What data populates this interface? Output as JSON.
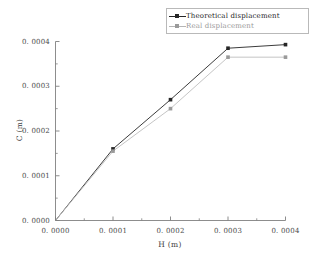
{
  "chart_data": {
    "type": "line",
    "title": "",
    "xlabel": "H (m)",
    "ylabel": "C (m)",
    "xlim": [
      0.0,
      0.0004
    ],
    "ylim": [
      0.0,
      0.0004
    ],
    "xticks": [
      "0. 0000",
      "0. 0001",
      "0. 0002",
      "0. 0003",
      "0. 0004"
    ],
    "xtick_values": [
      0.0,
      0.0001,
      0.0002,
      0.0003,
      0.0004
    ],
    "yticks": [
      "0. 0000",
      "0. 0001",
      "0. 0002",
      "0. 0003",
      "0. 0004"
    ],
    "ytick_values": [
      0.0,
      0.0001,
      0.0002,
      0.0003,
      0.0004
    ],
    "grid": false,
    "minor_ticks": true,
    "legend_position": "top-right",
    "x": [
      0.0,
      0.0001,
      0.0002,
      0.0003,
      0.0004
    ],
    "series": [
      {
        "name": "Theoretical displacement",
        "color": "#262626",
        "marker": "square",
        "values": [
          0.0,
          0.00016,
          0.00027,
          0.000385,
          0.000393
        ]
      },
      {
        "name": "Real displacement",
        "color": "#9a9a9a",
        "marker": "square",
        "values": [
          0.0,
          0.000155,
          0.00025,
          0.000365,
          0.000365
        ]
      }
    ]
  },
  "legend": {
    "items": [
      {
        "label": "Theoretical displacement"
      },
      {
        "label": "Real displacement"
      }
    ]
  },
  "axes": {
    "x_title": "H (m)",
    "y_title": "C (m)"
  },
  "colors": {
    "theoretical": "#262626",
    "real": "#9a9a9a",
    "axis": "#808080",
    "background": "#ffffff"
  }
}
